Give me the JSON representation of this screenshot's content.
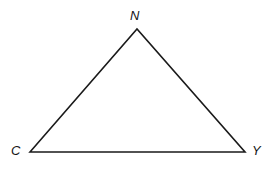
{
  "figure": {
    "kind": "geometry-diagram",
    "shape": "triangle",
    "name": "Triangle CNY",
    "background_color": "#ffffff",
    "stroke_color": "#1a1a1a",
    "stroke_width": 1.6,
    "canvas": {
      "width": 273,
      "height": 169
    },
    "vertices": [
      {
        "id": "N",
        "label": "N",
        "x": 137,
        "y": 29,
        "label_x": 130,
        "label_y": 9
      },
      {
        "id": "C",
        "label": "C",
        "x": 30,
        "y": 152,
        "label_x": 11,
        "label_y": 144
      },
      {
        "id": "Y",
        "label": "Y",
        "x": 245,
        "y": 152,
        "label_x": 252,
        "label_y": 144
      }
    ],
    "edges": [
      {
        "id": "CN",
        "from": "C",
        "to": "N"
      },
      {
        "id": "NY",
        "from": "N",
        "to": "Y"
      },
      {
        "id": "YC",
        "from": "Y",
        "to": "C"
      }
    ],
    "polygon_points": "30,152 137,29 245,152"
  }
}
